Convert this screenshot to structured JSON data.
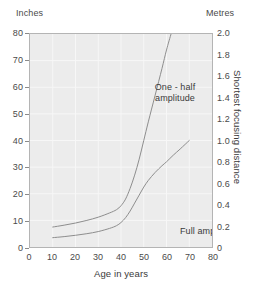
{
  "chart_data": {
    "type": "line",
    "title": "",
    "xlabel": "Age in years",
    "ylabel_left": "Inches",
    "ylabel_right": "Metres",
    "yaxis_right_title": "Shortest focusing distance",
    "xlim": [
      0,
      80
    ],
    "ylim_left": [
      0,
      80
    ],
    "ylim_right": [
      0,
      2.0
    ],
    "grid": true,
    "legend_position": "inline-annotations",
    "xticks": [
      0,
      10,
      20,
      30,
      40,
      50,
      60,
      70,
      80
    ],
    "yticks_left": [
      0,
      10,
      20,
      30,
      40,
      50,
      60,
      70,
      80
    ],
    "yticks_right": [
      "0",
      "0.2",
      "0.4",
      "0.6",
      "0.8",
      "1.0",
      "1.2",
      "1.4",
      "1.6",
      "1.8",
      "2.0"
    ],
    "series": [
      {
        "name": "One-half amplitude",
        "annotation": "One - half amplitude",
        "x": [
          10,
          15,
          20,
          25,
          30,
          35,
          38,
          40,
          42,
          44,
          46,
          48,
          50,
          52,
          55,
          58,
          60,
          62
        ],
        "values": [
          7.5,
          8.2,
          9.0,
          10.0,
          11.2,
          12.8,
          14.0,
          15.5,
          18.0,
          22.0,
          27.0,
          33.0,
          40.0,
          47.0,
          57.0,
          67.0,
          74.0,
          80.0
        ]
      },
      {
        "name": "Full amplitude",
        "annotation": "Full amplitude",
        "x": [
          10,
          15,
          20,
          25,
          30,
          35,
          38,
          40,
          42,
          44,
          46,
          48,
          50,
          52,
          55,
          58,
          60,
          63,
          66,
          70
        ],
        "values": [
          3.5,
          3.9,
          4.4,
          5.0,
          5.8,
          7.0,
          8.0,
          9.2,
          11.0,
          13.5,
          16.5,
          19.5,
          22.5,
          25.0,
          28.0,
          30.5,
          32.0,
          34.5,
          36.8,
          40.0
        ]
      }
    ]
  },
  "headers": {
    "left": "Inches",
    "right": "Metres"
  },
  "axis_titles": {
    "x": "Age in years",
    "right": "Shortest focusing distance"
  },
  "annotations": {
    "one_half_line1": "One - half",
    "one_half_line2": "amplitude",
    "full": "Full amplitude"
  },
  "colors": {
    "plot_background": "#ececec",
    "gridline": "#f7f7f7",
    "curve": "#8c8c8c",
    "axis": "#b4b4b4",
    "text": "#3a3a3a"
  }
}
